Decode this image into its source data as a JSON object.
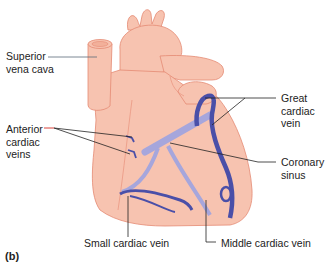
{
  "figure": {
    "panel_label": "(b)"
  },
  "labels": {
    "superior_vena_cava": "Superior\nvena cava",
    "anterior_cardiac_veins": "Anterior\ncardiac\nveins",
    "great_cardiac_vein": "Great\ncardiac\nvein",
    "coronary_sinus": "Coronary\nsinus",
    "small_cardiac_vein": "Small cardiac vein",
    "middle_cardiac_vein": "Middle cardiac vein"
  },
  "colors": {
    "heart_fill": "#f7c3b0",
    "heart_outline": "#e58a74",
    "vein_dark": "#4a4fa8",
    "vein_light": "#a6a6dc",
    "leader_line": "#222222",
    "svc_leader": "#5a6b78",
    "anterior_leader_accent": "#d9423a",
    "background": "#ffffff"
  }
}
